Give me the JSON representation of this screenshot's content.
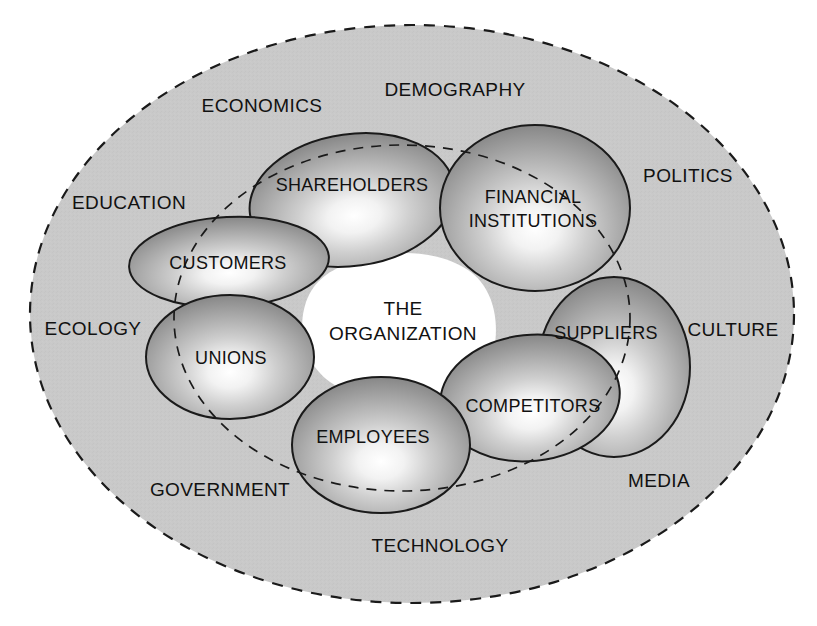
{
  "diagram": {
    "core": {
      "line1": "THE",
      "line2": "ORGANIZATION"
    },
    "colors": {
      "outer_fill": "#c9c9c9",
      "outer_stroke": "#1a1a1a",
      "sphere_highlight": "#ffffff",
      "sphere_mid": "#b4b4b4",
      "sphere_edge": "#6f6f6f",
      "sphere_stroke": "#1a1a1a",
      "core_fill": "#ffffff",
      "text": "#111111",
      "page_background": "#ffffff"
    },
    "environment_labels": [
      {
        "name": "demography",
        "text": "DEMOGRAPHY",
        "x": 455,
        "y": 96
      },
      {
        "name": "economics",
        "text": "ECONOMICS",
        "x": 262,
        "y": 112
      },
      {
        "name": "politics",
        "text": "POLITICS",
        "x": 688,
        "y": 182
      },
      {
        "name": "education",
        "text": "EDUCATION",
        "x": 129,
        "y": 209
      },
      {
        "name": "ecology",
        "text": "ECOLOGY",
        "x": 93,
        "y": 335
      },
      {
        "name": "culture",
        "text": "CULTURE",
        "x": 733,
        "y": 336
      },
      {
        "name": "government",
        "text": "GOVERNMENT",
        "x": 220,
        "y": 496
      },
      {
        "name": "media",
        "text": "MEDIA",
        "x": 659,
        "y": 487
      },
      {
        "name": "technology",
        "text": "TECHNOLOGY",
        "x": 440,
        "y": 552
      }
    ],
    "stakeholders": [
      {
        "name": "shareholders",
        "text": "SHAREHOLDERS",
        "cx": 352,
        "cy": 200,
        "rx": 103,
        "ry": 66,
        "rot": -8,
        "hx": 0.52,
        "hy": 0.62,
        "lx": 352,
        "ly": 191,
        "lines": [
          "SHAREHOLDERS"
        ]
      },
      {
        "name": "financial-institutions",
        "text": "FINANCIAL INSTITUTIONS",
        "cx": 535,
        "cy": 208,
        "rx": 95,
        "ry": 83,
        "rot": 0,
        "hx": 0.5,
        "hy": 0.62,
        "lx": 533,
        "ly": 203,
        "lines": [
          "FINANCIAL",
          "INSTITUTIONS"
        ]
      },
      {
        "name": "customers",
        "text": "CUSTOMERS",
        "cx": 229,
        "cy": 262,
        "rx": 100,
        "ry": 45,
        "rot": -3,
        "hx": 0.52,
        "hy": 0.62,
        "lx": 228,
        "ly": 269,
        "lines": [
          "CUSTOMERS"
        ]
      },
      {
        "name": "suppliers",
        "text": "SUPPLIERS",
        "cx": 614,
        "cy": 367,
        "rx": 76,
        "ry": 90,
        "rot": 0,
        "hx": 0.52,
        "hy": 0.62,
        "lx": 606,
        "ly": 339,
        "lines": [
          "SUPPLIERS"
        ]
      },
      {
        "name": "unions",
        "text": "UNIONS",
        "cx": 230,
        "cy": 357,
        "rx": 84,
        "ry": 62,
        "rot": 0,
        "hx": 0.54,
        "hy": 0.64,
        "lx": 231,
        "ly": 364,
        "lines": [
          "UNIONS"
        ]
      },
      {
        "name": "competitors",
        "text": "COMPETITORS",
        "cx": 530,
        "cy": 398,
        "rx": 90,
        "ry": 63,
        "rot": -6,
        "hx": 0.5,
        "hy": 0.64,
        "lx": 533,
        "ly": 412,
        "lines": [
          "COMPETITORS"
        ]
      },
      {
        "name": "employees",
        "text": "EMPLOYEES",
        "cx": 381,
        "cy": 445,
        "rx": 89,
        "ry": 68,
        "rot": 0,
        "hx": 0.52,
        "hy": 0.63,
        "lx": 373,
        "ly": 443,
        "lines": [
          "EMPLOYEES"
        ]
      }
    ],
    "boundaries": {
      "outer": {
        "name": "environment-boundary",
        "cx": 412,
        "cy": 314,
        "rx": 382,
        "ry": 289,
        "dash": "11 9"
      },
      "inner": {
        "name": "task-environment-boundary",
        "cx": 402,
        "cy": 318,
        "rx": 228,
        "ry": 173,
        "dash": "10 8"
      }
    }
  }
}
